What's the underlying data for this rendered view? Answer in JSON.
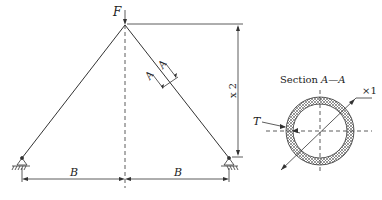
{
  "truss": {
    "load_label": "F",
    "height_label": "x 2",
    "left_span_label": "B",
    "right_span_label": "B",
    "section_cut_label_1": "A",
    "section_cut_label_2": "A"
  },
  "section": {
    "title_prefix": "Section",
    "title_cut": "A—A",
    "diameter_label": "×1",
    "thickness_label": "T"
  },
  "colors": {
    "line": "#333333",
    "hatch": "#555555",
    "background": "#ffffff"
  }
}
